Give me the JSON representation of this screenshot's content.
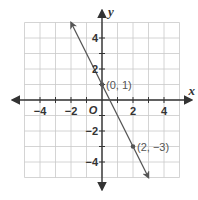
{
  "chart_data": {
    "type": "line",
    "title": "",
    "xlabel": "x",
    "ylabel": "y",
    "xlim": [
      -5,
      5
    ],
    "ylim": [
      -5,
      5
    ],
    "grid": true,
    "x_ticks": [
      -4,
      -2,
      2,
      4
    ],
    "y_ticks": [
      -4,
      -2,
      2,
      4
    ],
    "x_tick_labels": [
      "−4",
      "−2",
      "2",
      "4"
    ],
    "y_tick_labels": [
      "−4",
      "−2",
      "2",
      "4"
    ],
    "origin_label": "O",
    "series": [
      {
        "name": "line",
        "slope": -2,
        "intercept": 1,
        "x": [
          -2,
          3
        ],
        "y": [
          5,
          -5
        ],
        "arrows_both_ends": true
      }
    ],
    "points": [
      {
        "x": 0,
        "y": 1,
        "label": "(0, 1)"
      },
      {
        "x": 2,
        "y": -3,
        "label": "(2, −3)"
      }
    ],
    "colors": {
      "grid": "#c9c9c9",
      "axis": "#333333",
      "line": "#555555"
    }
  }
}
